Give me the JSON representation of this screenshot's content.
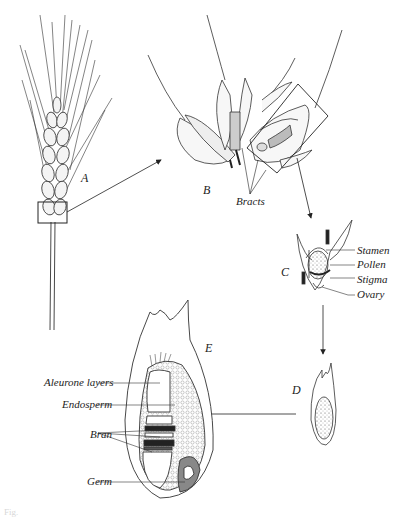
{
  "figure": {
    "panels": {
      "A": {
        "letter": "A",
        "description": "wheat ear (spike) with highlighted spikelet"
      },
      "B": {
        "letter": "B",
        "description": "spikelet with florets"
      },
      "C": {
        "letter": "C",
        "description": "floret"
      },
      "D": {
        "letter": "D",
        "description": "grain (kernel)"
      },
      "E": {
        "letter": "E",
        "description": "longitudinal section of grain"
      }
    },
    "labels": {
      "bracts": "Bracts",
      "stamen": "Stamen",
      "pollen": "Pollen",
      "stigma": "Stigma",
      "ovary": "Ovary",
      "aleurone": "Aleurone layers",
      "endosperm": "Endosperm",
      "bran": "Bran",
      "germ": "Germ"
    },
    "caption_fragment": "Fig."
  },
  "colors": {
    "ink": "#222222",
    "background": "#ffffff"
  }
}
